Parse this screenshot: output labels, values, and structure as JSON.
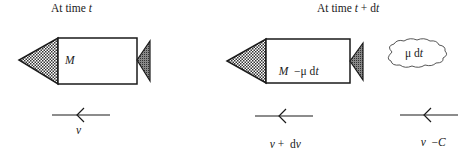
{
  "headings": {
    "left": {
      "prefix": "At time ",
      "var": "t",
      "suffix": ""
    },
    "right": {
      "prefix": "At time ",
      "var": "t",
      "suffix": " + d",
      "var2": "t"
    }
  },
  "rocket_before": {
    "mass_label": {
      "var": "M"
    }
  },
  "rocket_after": {
    "mass_label": {
      "var": "M",
      "mid": "  −μ d",
      "var2": "t"
    }
  },
  "exhaust_cloud": {
    "label": {
      "prefix": "μ d",
      "var": "t"
    }
  },
  "velocities": {
    "before": {
      "var": "v",
      "rest": ""
    },
    "after": {
      "var": "v",
      "mid": " +  d",
      "var2": "v"
    },
    "exhaust": {
      "var": "v",
      "mid": "  −",
      "var2": "C"
    }
  },
  "colors": {
    "stroke": "#1a1a1a",
    "nose_fill": "#555555",
    "fin_fill": "#666666",
    "background": "#ffffff"
  }
}
